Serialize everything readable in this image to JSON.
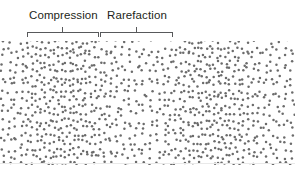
{
  "figure": {
    "width": 295,
    "height": 170,
    "background_color": "#ffffff"
  },
  "labels": {
    "compression": "Compression",
    "rarefaction": "Rarefaction",
    "text_color": "#231f20",
    "font_size_px": 11.5
  },
  "brackets": {
    "color": "#58595b",
    "stroke_width": 1,
    "baseline_y": 32,
    "tick_height": 5,
    "items": [
      {
        "name": "compression-bracket",
        "x_start": 27,
        "x_end": 98,
        "center_tick_x": 62
      },
      {
        "name": "rarefaction-bracket",
        "x_start": 100,
        "x_end": 172,
        "center_tick_x": 136
      }
    ]
  },
  "dot_field": {
    "top": 41,
    "height": 124,
    "dot_color": "#6b6b6b",
    "dot_radius_px": 1.25,
    "edge_color": "#e9e9e9",
    "base_spacing_px": 7.2
  },
  "chart_data": {
    "type": "scatter",
    "xlabel": "",
    "ylabel": "",
    "xlim": [
      0,
      295
    ],
    "ylim": [
      0,
      124
    ],
    "grid": false,
    "legend_position": "none",
    "annotations": [
      {
        "label": "Compression",
        "x_range": [
          27,
          98
        ],
        "tick_x": 62
      },
      {
        "label": "Rarefaction",
        "x_range": [
          100,
          172
        ],
        "tick_x": 136
      }
    ],
    "density_wave": {
      "wavelength_px": 148,
      "phase_offset_px": 62,
      "amplitude": 0.82,
      "baseline_density": 1.0,
      "compression_centers_x": [
        62,
        210
      ],
      "rarefaction_centers_x": [
        -12,
        136,
        284
      ]
    }
  }
}
